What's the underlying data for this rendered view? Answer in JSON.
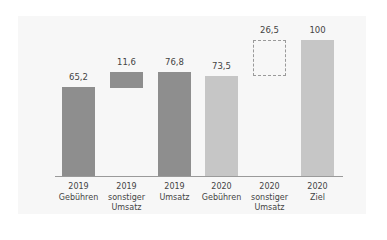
{
  "chart_data": {
    "type": "bar",
    "subtype": "waterfall",
    "title": "",
    "xlabel": "",
    "ylabel": "",
    "ylim": [
      0,
      100
    ],
    "grid": false,
    "legend": null,
    "categories": [
      [
        "2019",
        "Gebühren"
      ],
      [
        "2019",
        "sonstiger",
        "Umsatz"
      ],
      [
        "2019",
        "Umsatz"
      ],
      [
        "2020",
        "Gebühren"
      ],
      [
        "2020",
        "sonstiger",
        "Umsatz"
      ],
      [
        "2020",
        "Ziel"
      ]
    ],
    "values": [
      65.2,
      11.6,
      76.8,
      73.5,
      26.5,
      100
    ],
    "value_labels": [
      "65,2",
      "11,6",
      "76,8",
      "73,5",
      "26,5",
      "100"
    ],
    "bars": [
      {
        "label": "2019 Gebühren",
        "base": 0,
        "value": 65.2,
        "style": "dark"
      },
      {
        "label": "2019 sonstiger Umsatz",
        "base": 65.2,
        "value": 11.6,
        "style": "dark"
      },
      {
        "label": "2019 Umsatz",
        "base": 0,
        "value": 76.8,
        "style": "dark"
      },
      {
        "label": "2020 Gebühren",
        "base": 0,
        "value": 73.5,
        "style": "light"
      },
      {
        "label": "2020 sonstiger Umsatz",
        "base": 73.5,
        "value": 26.5,
        "style": "dashed"
      },
      {
        "label": "2020 Ziel",
        "base": 0,
        "value": 100,
        "style": "light"
      }
    ],
    "colors": {
      "dark": "#8e8e8e",
      "light": "#c6c6c6",
      "dashed_border": "#9a9a9a"
    }
  }
}
